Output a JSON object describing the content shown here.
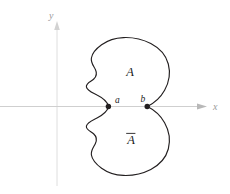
{
  "figure": {
    "background_color": "#ffffff",
    "axes": {
      "x_axis": {
        "label": "x",
        "color": "#c9c9c9",
        "label_color": "#9a9a9a",
        "y_position": 106,
        "x_start": 0,
        "x_end": 205,
        "arrow": "right-arrow-icon"
      },
      "y_axis": {
        "label": "y",
        "color": "#dcdcdc",
        "label_color": "#9a9a9a",
        "x_position": 57,
        "y_start": 186,
        "y_end": 22,
        "arrow": "up-arrow-icon"
      }
    },
    "curve": {
      "color": "#231f20",
      "stroke_width": 1.15,
      "description": "closed region with wavy left boundary, symmetric about the x-axis, meeting at two cusp points"
    },
    "regions": {
      "upper": {
        "label": "A",
        "label_x": 130,
        "label_y": 75
      },
      "lower": {
        "label": "A",
        "has_overbar": true,
        "label_x": 131,
        "label_y": 141
      }
    },
    "points": [
      {
        "name": "a",
        "label": "a",
        "x": 108,
        "y": 106.5,
        "label_x": 115,
        "label_y": 102,
        "dot_color": "#231f20",
        "dot_radius": 2.6
      },
      {
        "name": "b",
        "label": "b",
        "x": 147,
        "y": 106.5,
        "label_x": 140,
        "label_y": 101,
        "dot_color": "#231f20",
        "dot_radius": 2.6
      }
    ]
  }
}
